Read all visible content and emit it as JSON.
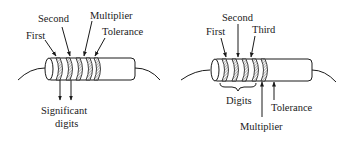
{
  "diagrams": [
    {
      "id": "four-band",
      "labels": {
        "first": "First",
        "second": "Second",
        "multiplier": "Multiplier",
        "tolerance": "Tolerance",
        "significant_line1": "Significant",
        "significant_line2": "digits"
      }
    },
    {
      "id": "five-band",
      "labels": {
        "first": "First",
        "second": "Second",
        "third": "Third",
        "digits": "Digits",
        "multiplier": "Multiplier",
        "tolerance": "Tolerance"
      }
    }
  ],
  "colors": {
    "ink": "#1a1a1a",
    "background": "#ffffff"
  }
}
